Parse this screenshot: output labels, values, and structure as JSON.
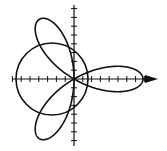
{
  "figure": {
    "stroke_color": "#111111",
    "background": "#ffffff"
  },
  "axes": {
    "origin": [
      74,
      79
    ],
    "x_axis": {
      "from": 12,
      "to": 158,
      "arrow_right": true
    },
    "y_axis": {
      "from": 5,
      "to": 146
    },
    "tick_spacing_px": 8.8,
    "tick_half_length_px": 3
  },
  "curves": {
    "rose": {
      "equation": "r = cos(3θ)",
      "petals": 3,
      "petal_length_px": 69
    },
    "circle": {
      "equation": "r = -cos(θ)",
      "center": [
        52,
        79
      ],
      "radius_px": 36
    }
  }
}
